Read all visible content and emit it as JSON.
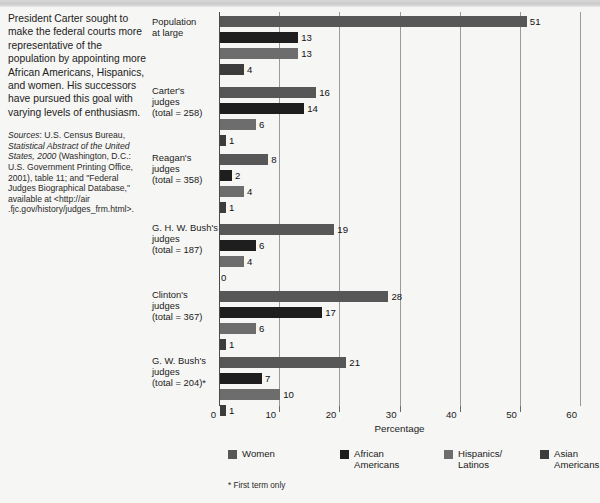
{
  "blurb": "President Carter sought to make the federal courts more representative of the population by appointing more African Americans, Hispanics, and women. His successors have pursued this goal with varying levels of enthusiasm.",
  "sources": {
    "label": "Sources",
    "line1": ": U.S. Census Bureau, ",
    "title": "Statistical Abstract of the United States, 2000",
    "rest": " (Washington, D.C.: U.S. Government Printing Office, 2001), table 11; and \"Federal Judges Biographical Database,\" available at <http://air .fjc.gov/history/judges_frm.html>."
  },
  "footnote": "* First term only",
  "chart_data": {
    "type": "bar",
    "orientation": "horizontal",
    "title": "",
    "xlabel": "Percentage",
    "ylabel": "",
    "xlim": [
      0,
      60
    ],
    "xticks": [
      0,
      10,
      20,
      30,
      40,
      50,
      60
    ],
    "grid": true,
    "legend_position": "bottom",
    "categories": [
      {
        "lines": [
          "Population",
          "at large"
        ]
      },
      {
        "lines": [
          "Carter's",
          "judges",
          "(total = 258)"
        ]
      },
      {
        "lines": [
          "Reagan's",
          "judges",
          "(total = 358)"
        ]
      },
      {
        "lines": [
          "G. H. W. Bush's",
          "judges",
          "(total = 187)"
        ]
      },
      {
        "lines": [
          "Clinton's",
          "judges",
          "(total = 367)"
        ]
      },
      {
        "lines": [
          "G. W. Bush's",
          "judges",
          "(total = 204)*"
        ]
      }
    ],
    "series": [
      {
        "name": "Women",
        "color": "#575757",
        "values": [
          51,
          16,
          8,
          19,
          28,
          21
        ]
      },
      {
        "name": "African Americans",
        "color": "#1e1e1e",
        "values": [
          13,
          14,
          2,
          6,
          17,
          7
        ]
      },
      {
        "name": "Hispanics/Latinos",
        "color": "#6d6d6d",
        "values": [
          13,
          6,
          4,
          4,
          6,
          10
        ]
      },
      {
        "name": "Asian Americans",
        "color": "#3c3c3c",
        "values": [
          4,
          1,
          1,
          0,
          1,
          1
        ]
      }
    ],
    "legend": [
      {
        "label_lines": [
          "Women"
        ],
        "color": "#575757"
      },
      {
        "label_lines": [
          "African",
          "Americans"
        ],
        "color": "#1e1e1e"
      },
      {
        "label_lines": [
          "Hispanics/",
          "Latinos"
        ],
        "color": "#6d6d6d"
      },
      {
        "label_lines": [
          "Asian",
          "Americans"
        ],
        "color": "#3c3c3c"
      }
    ]
  }
}
